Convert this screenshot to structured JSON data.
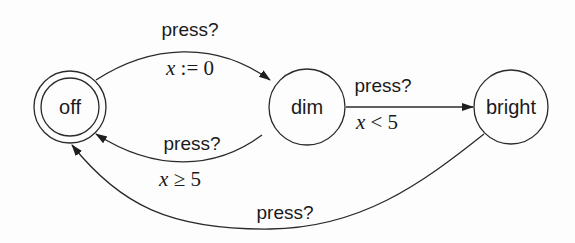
{
  "diagram": {
    "type": "timed-automaton",
    "states": [
      {
        "id": "off",
        "label": "off",
        "initial": true,
        "cx": 70,
        "cy": 107,
        "r": 36
      },
      {
        "id": "dim",
        "label": "dim",
        "initial": false,
        "cx": 307,
        "cy": 107,
        "r": 38
      },
      {
        "id": "bright",
        "label": "bright",
        "initial": false,
        "cx": 511,
        "cy": 107,
        "r": 37
      }
    ],
    "transitions": [
      {
        "from": "off",
        "to": "dim",
        "action": "press?",
        "guard_var": "x",
        "guard_rest": " := 0"
      },
      {
        "from": "dim",
        "to": "bright",
        "action": "press?",
        "guard_var": "x",
        "guard_rest": " < 5"
      },
      {
        "from": "dim",
        "to": "off",
        "action": "press?",
        "guard_var": "x",
        "guard_rest": " ≥ 5"
      },
      {
        "from": "bright",
        "to": "off",
        "action": "press?"
      }
    ]
  },
  "colors": {
    "stroke": "#2a2a2a",
    "text": "#1a1a1a",
    "background": "#fdfdfd"
  }
}
